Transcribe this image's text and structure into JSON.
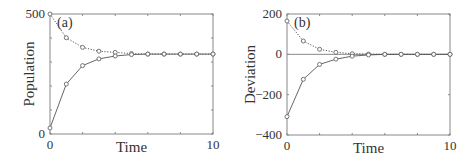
{
  "chart_data": [
    {
      "panel_label": "(a)",
      "type": "line",
      "title": "",
      "xlabel": "Time",
      "ylabel": "Population",
      "xlim": [
        0,
        10
      ],
      "ylim": [
        0,
        500
      ],
      "xticks": [
        0,
        5,
        10
      ],
      "xtick_labels": [
        "0",
        "",
        "10"
      ],
      "yticks": [
        0,
        100,
        200,
        300,
        400,
        500
      ],
      "ytick_labels": [
        "0",
        "",
        "",
        "",
        "",
        "500"
      ],
      "grid": false,
      "legend": null,
      "x": [
        0,
        1,
        2,
        3,
        4,
        5,
        6,
        7,
        8,
        9,
        10
      ],
      "series": [
        {
          "name": "from above",
          "style": "dotted",
          "marker": "circle",
          "values": [
            500,
            401,
            361,
            345,
            340,
            335,
            333,
            333,
            333,
            333,
            333
          ]
        },
        {
          "name": "from below",
          "style": "solid",
          "marker": "circle",
          "values": [
            25,
            208,
            285,
            313,
            325,
            331,
            333,
            333,
            333,
            333,
            333
          ]
        }
      ],
      "reference_lines": []
    },
    {
      "panel_label": "(b)",
      "type": "line",
      "title": "",
      "xlabel": "Time",
      "ylabel": "Deviation",
      "xlim": [
        0,
        10
      ],
      "ylim": [
        -400,
        200
      ],
      "xticks": [
        0,
        5,
        10
      ],
      "xtick_labels": [
        "0",
        "",
        "10"
      ],
      "yticks": [
        -400,
        -200,
        0,
        200
      ],
      "ytick_labels": [
        "-400",
        "-200",
        "0",
        "200"
      ],
      "grid": false,
      "legend": null,
      "x": [
        0,
        1,
        2,
        3,
        4,
        5,
        6,
        7,
        8,
        9,
        10
      ],
      "series": [
        {
          "name": "from above",
          "style": "dotted",
          "marker": "circle",
          "values": [
            165,
            66,
            25,
            10,
            3,
            1,
            0,
            0,
            0,
            0,
            0
          ]
        },
        {
          "name": "from below",
          "style": "solid",
          "marker": "circle",
          "values": [
            -309,
            -124,
            -50,
            -24,
            -9,
            -3,
            0,
            0,
            0,
            0,
            0
          ]
        }
      ],
      "reference_lines": [
        0
      ]
    }
  ],
  "layout": {
    "panels": [
      {
        "left": 50,
        "top": 14,
        "right": 213,
        "bottom": 134
      },
      {
        "left": 287,
        "top": 14,
        "right": 450,
        "bottom": 135
      }
    ],
    "colors": {
      "axis": "#888888",
      "line": "#555555",
      "marker": "#666666",
      "text": "#333333"
    }
  }
}
